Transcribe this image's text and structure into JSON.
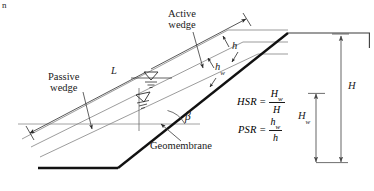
{
  "figure": {
    "artifact_glyph": "n",
    "labels": {
      "active_wedge_line1": "Active",
      "active_wedge_line2": "wedge",
      "passive_wedge_line1": "Passive",
      "passive_wedge_line2": "wedge",
      "geomembrane": "Geomembrane",
      "length_L": "L",
      "thickness_h": "h",
      "thickness_hw_base": "h",
      "thickness_hw_sub": "w",
      "beta": "β",
      "height_H": "H",
      "height_Hw_base": "H",
      "height_Hw_sub": "w"
    },
    "equations": [
      {
        "name": "hsr",
        "lhs": "HSR",
        "operator": "=",
        "numerator_base": "H",
        "numerator_sub": "w",
        "denominator_base": "H",
        "denominator_sub": ""
      },
      {
        "name": "psr",
        "lhs": "PSR",
        "operator": "=",
        "numerator_base": "h",
        "numerator_sub": "w",
        "denominator_base": "h",
        "denominator_sub": ""
      }
    ],
    "colors": {
      "ink": "#1a1a1a",
      "geomembrane_line": "#111111",
      "thin_line": "#6b6b6b",
      "background": "#ffffff",
      "dimension_line": "#555555"
    },
    "geometry": {
      "slope_angle_label": "β",
      "crest_x": 288,
      "crest_y": 33,
      "toe_x": 118,
      "toe_y": 168,
      "water_table_symbols": 2
    }
  }
}
